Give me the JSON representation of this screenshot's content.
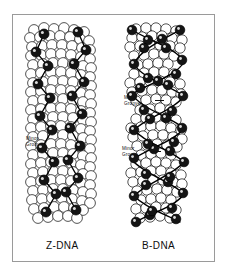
{
  "figure": {
    "background_color": "#ffffff",
    "frame_color": "#9a9a9a",
    "ink_color": "#111111"
  },
  "panels": [
    {
      "id": "z-dna",
      "caption": "Z-DNA",
      "annotations": [
        {
          "id": "z-minor-groove",
          "line1": "Minor",
          "line2": "Groove",
          "leader": false
        }
      ]
    },
    {
      "id": "b-dna",
      "caption": "B-DNA",
      "annotations": [
        {
          "id": "b-major-groove",
          "line1": "Major",
          "line2": "Groove",
          "leader": true
        },
        {
          "id": "b-minor-groove",
          "line1": "Minor",
          "line2": "Groove",
          "leader": true
        }
      ]
    }
  ],
  "captions": {
    "left": "Z-DNA",
    "right": "B-DNA"
  },
  "annotation_text": {
    "z_minor_line1": "Minor",
    "z_minor_line2": "Groove",
    "b_major_line1": "Major",
    "b_major_line2": "Groove",
    "b_minor_line1": "Minor",
    "b_minor_line2": "Groove"
  }
}
